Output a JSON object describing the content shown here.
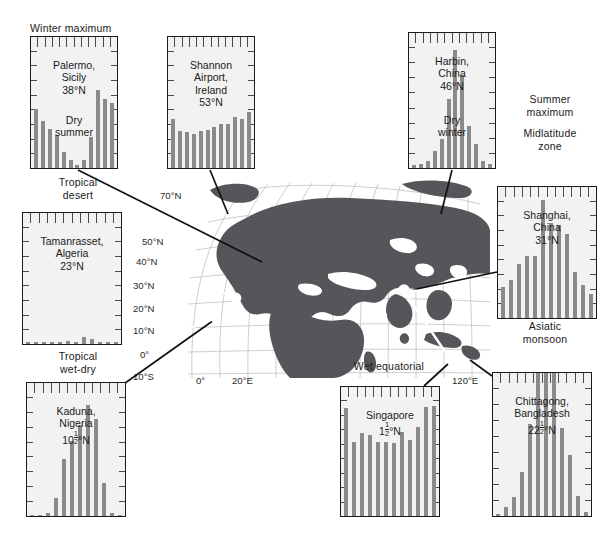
{
  "figure": {
    "annotations": [
      {
        "name": "winter-maximum",
        "text": "Winter maximum",
        "x": 30,
        "y": 22,
        "w": 110,
        "align": "left"
      },
      {
        "name": "tropical-desert",
        "text": "Tropical\ndesert",
        "x": 22,
        "y": 176,
        "w": 112,
        "align": "center"
      },
      {
        "name": "tropical-wet-dry",
        "text": "Tropical\nwet-dry",
        "x": 22,
        "y": 350,
        "w": 112,
        "align": "center"
      },
      {
        "name": "summer-maximum",
        "text": "Summer\nmaximum",
        "x": 500,
        "y": 93,
        "w": 100,
        "align": "center"
      },
      {
        "name": "midlatitude-zone",
        "text": "Midlatitude\nzone",
        "x": 498,
        "y": 127,
        "w": 104,
        "align": "center"
      },
      {
        "name": "asiatic-monsoon",
        "text": "Asiatic\nmonsoon",
        "x": 495,
        "y": 320,
        "w": 100,
        "align": "center"
      },
      {
        "name": "wet-equatorial",
        "text": "Wet equatorial",
        "x": 330,
        "y": 360,
        "w": 118,
        "align": "center"
      }
    ],
    "map": {
      "lat_labels": [
        {
          "text": "70°N",
          "x": 160,
          "y": 190
        },
        {
          "text": "50°N",
          "x": 142,
          "y": 236
        },
        {
          "text": "40°N",
          "x": 136,
          "y": 256
        },
        {
          "text": "30°N",
          "x": 133,
          "y": 280
        },
        {
          "text": "20°N",
          "x": 133,
          "y": 303
        },
        {
          "text": "10°N",
          "x": 133,
          "y": 325
        },
        {
          "text": "0°",
          "x": 140,
          "y": 349
        },
        {
          "text": "10°S",
          "x": 133,
          "y": 371
        }
      ],
      "lon_labels": [
        {
          "text": "0°",
          "x": 196,
          "y": 375
        },
        {
          "text": "20°E",
          "x": 232,
          "y": 375
        },
        {
          "text": "120°E",
          "x": 455,
          "y": 375
        }
      ]
    }
  },
  "chart_data": [
    {
      "id": "palermo",
      "type": "bar",
      "title": "Palermo,\nSicily\n38°N",
      "subtitle": "Dry\nsummer",
      "categories": [
        "J",
        "F",
        "M",
        "A",
        "M",
        "J",
        "J",
        "A",
        "S",
        "O",
        "N",
        "D"
      ],
      "values": [
        72,
        58,
        48,
        40,
        20,
        10,
        4,
        10,
        38,
        95,
        84,
        80
      ],
      "ylim": [
        0,
        160
      ],
      "box": {
        "x": 30,
        "y": 36,
        "w": 88,
        "h": 133
      }
    },
    {
      "id": "shannon-airport",
      "type": "bar",
      "title": "Shannon\nAirport,\nIreland\n53°N",
      "subtitle": "",
      "categories": [
        "J",
        "F",
        "M",
        "A",
        "M",
        "J",
        "J",
        "A",
        "S",
        "O",
        "N",
        "D"
      ],
      "values": [
        60,
        45,
        44,
        42,
        45,
        46,
        50,
        54,
        54,
        62,
        60,
        68
      ],
      "ylim": [
        0,
        160
      ],
      "box": {
        "x": 167,
        "y": 36,
        "w": 88,
        "h": 133
      }
    },
    {
      "id": "harbin",
      "type": "bar",
      "title": "Harbin,\nChina\n46°N",
      "subtitle": "Dry\nwinter",
      "categories": [
        "J",
        "F",
        "M",
        "A",
        "M",
        "J",
        "J",
        "A",
        "S",
        "O",
        "N",
        "D"
      ],
      "values": [
        4,
        5,
        8,
        20,
        35,
        82,
        140,
        110,
        50,
        28,
        8,
        5
      ],
      "ylim": [
        0,
        160
      ],
      "box": {
        "x": 408,
        "y": 32,
        "w": 88,
        "h": 137
      }
    },
    {
      "id": "tamanrasset",
      "type": "bar",
      "title": "Tamanrasset,\nAlgeria\n23°N",
      "subtitle": "",
      "categories": [
        "J",
        "F",
        "M",
        "A",
        "M",
        "J",
        "J",
        "A",
        "S",
        "O",
        "N",
        "D"
      ],
      "values": [
        3,
        2,
        3,
        2,
        3,
        4,
        3,
        8,
        6,
        3,
        3,
        3
      ],
      "ylim": [
        0,
        160
      ],
      "box": {
        "x": 22,
        "y": 212,
        "w": 100,
        "h": 133
      }
    },
    {
      "id": "shanghai",
      "type": "bar",
      "title": "Shanghai,\nChina\n31°N",
      "subtitle": "",
      "categories": [
        "J",
        "F",
        "M",
        "A",
        "M",
        "J",
        "J",
        "A",
        "S",
        "O",
        "N",
        "D"
      ],
      "values": [
        48,
        58,
        82,
        94,
        94,
        180,
        145,
        142,
        128,
        71,
        51,
        36
      ],
      "ylim": [
        0,
        200
      ],
      "box": {
        "x": 497,
        "y": 186,
        "w": 100,
        "h": 133
      }
    },
    {
      "id": "kaduna",
      "type": "bar",
      "title": "Kaduna,\nNigeria\n10½°N",
      "subtitle": "",
      "categories": [
        "J",
        "F",
        "M",
        "A",
        "M",
        "J",
        "J",
        "A",
        "S",
        "O",
        "N",
        "D"
      ],
      "values": [
        2,
        2,
        8,
        40,
        128,
        170,
        205,
        250,
        220,
        74,
        6,
        2
      ],
      "ylim": [
        0,
        300
      ],
      "box": {
        "x": 26,
        "y": 382,
        "w": 100,
        "h": 135
      }
    },
    {
      "id": "singapore",
      "type": "bar",
      "title": "Singapore\n1½°N",
      "subtitle": "",
      "categories": [
        "J",
        "F",
        "M",
        "A",
        "M",
        "J",
        "J",
        "A",
        "S",
        "O",
        "N",
        "D"
      ],
      "values": [
        252,
        173,
        193,
        188,
        172,
        172,
        170,
        196,
        178,
        208,
        254,
        257
      ],
      "ylim": [
        0,
        300
      ],
      "box": {
        "x": 340,
        "y": 386,
        "w": 100,
        "h": 131
      }
    },
    {
      "id": "chittagong",
      "type": "bar",
      "title": "Chittagong,\nBangladesh\n22½°N",
      "subtitle": "",
      "categories": [
        "J",
        "F",
        "M",
        "A",
        "M",
        "J",
        "J",
        "A",
        "S",
        "O",
        "N",
        "D"
      ],
      "values": [
        6,
        28,
        55,
        130,
        270,
        600,
        610,
        480,
        260,
        180,
        60,
        12
      ],
      "ylim": [
        0,
        420
      ],
      "box": {
        "x": 492,
        "y": 372,
        "w": 100,
        "h": 145
      }
    }
  ]
}
